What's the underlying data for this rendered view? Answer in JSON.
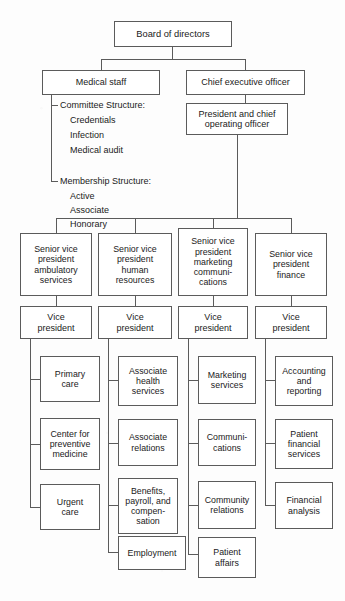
{
  "nodes": {
    "board": "Board of directors",
    "medical_staff": "Medical staff",
    "ceo": "Chief executive officer",
    "coo": "President and chief\noperating officer"
  },
  "medical_staff_lists": [
    {
      "heading": "Committee Structure:",
      "items": [
        "Credentials",
        "Infection",
        "Medical audit"
      ]
    },
    {
      "heading": "Membership Structure:",
      "items": [
        "Active",
        "Associate",
        "Honorary"
      ]
    }
  ],
  "columns": [
    {
      "svp": "Senior vice\npresident\nambulatory\nservices",
      "vp": "Vice\npresident",
      "units": [
        "Primary\ncare",
        "Center for\npreventive\nmedicine",
        "Urgent\ncare"
      ]
    },
    {
      "svp": "Senior vice\npresident\nhuman\nresources",
      "vp": "Vice\npresident",
      "units": [
        "Associate\nhealth\nservices",
        "Associate\nrelations",
        "Benefits,\npayroll, and\ncompen-\nsation",
        "Employment"
      ]
    },
    {
      "svp": "Senior vice\npresident\nmarketing\ncommuni-\ncations",
      "vp": "Vice\npresident",
      "units": [
        "Marketing\nservices",
        "Communi-\ncations",
        "Community\nrelations",
        "Patient\naffairs"
      ]
    },
    {
      "svp": "Senior vice\npresident\nfinance",
      "vp": "Vice\npresident",
      "units": [
        "Accounting\nand\nreporting",
        "Patient\nfinancial\nservices",
        "Financial\nanalysis"
      ]
    }
  ],
  "colors": {
    "line": "#5b5b5b",
    "box_fill": "#ffffff",
    "text": "#1a1a1a",
    "background": "#fdfdfd"
  }
}
